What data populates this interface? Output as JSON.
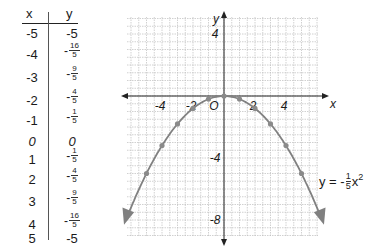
{
  "table": {
    "x_header": "x",
    "y_header": "y",
    "rows": [
      {
        "x": "-5",
        "y": "-5"
      },
      {
        "x": "-4",
        "y_num": "16",
        "y_den": "5",
        "y_neg": "-"
      },
      {
        "x": "-3",
        "y_num": "9",
        "y_den": "5",
        "y_neg": "-"
      },
      {
        "x": "-2",
        "y_num": "4",
        "y_den": "5",
        "y_neg": "-"
      },
      {
        "x": "-1",
        "y_num": "1",
        "y_den": "5",
        "y_neg": "-"
      },
      {
        "x": "0",
        "y": "0"
      },
      {
        "x": "1",
        "y_num": "1",
        "y_den": "5",
        "y_neg": "-"
      },
      {
        "x": "2",
        "y_num": "4",
        "y_den": "5",
        "y_neg": "-"
      },
      {
        "x": "3",
        "y_num": "9",
        "y_den": "5",
        "y_neg": "-"
      },
      {
        "x": "4",
        "y_num": "16",
        "y_den": "5",
        "y_neg": "-"
      },
      {
        "x": "5",
        "y": "-5"
      }
    ]
  },
  "equation": {
    "lhs": "y = -",
    "num": "1",
    "den": "5",
    "var": "x",
    "exp": "2"
  },
  "axis_labels": {
    "x": "x",
    "y": "y",
    "origin": "O",
    "x_ticks": [
      "-4",
      "-2",
      "2",
      "4"
    ],
    "y_ticks": [
      "4",
      "-4",
      "-8"
    ]
  },
  "colors": {
    "curve": "#808080",
    "point": "#8a8a8a",
    "axis": "#222222",
    "grid": "#bdbdbd"
  },
  "chart_data": {
    "type": "line",
    "title": "",
    "function": "y = -(1/5)x^2",
    "xlabel": "x",
    "ylabel": "y",
    "xlim": [
      -6,
      6
    ],
    "ylim": [
      -9,
      5
    ],
    "grid": true,
    "x_tick_labels": [
      -4,
      -2,
      2,
      4
    ],
    "y_tick_labels": [
      4,
      -4,
      -8
    ],
    "series": [
      {
        "name": "y = -1/5 x^2",
        "x": [
          -5,
          -4,
          -3,
          -2,
          -1,
          0,
          1,
          2,
          3,
          4,
          5
        ],
        "y": [
          -5,
          -3.2,
          -1.8,
          -0.8,
          -0.2,
          0,
          -0.2,
          -0.8,
          -1.8,
          -3.2,
          -5
        ]
      }
    ],
    "table_columns": [
      "x",
      "y"
    ],
    "table_rows": [
      [
        "-5",
        "-5"
      ],
      [
        "-4",
        "-16/5"
      ],
      [
        "-3",
        "-9/5"
      ],
      [
        "-2",
        "-4/5"
      ],
      [
        "-1",
        "-1/5"
      ],
      [
        "0",
        "0"
      ],
      [
        "1",
        "-1/5"
      ],
      [
        "2",
        "-4/5"
      ],
      [
        "3",
        "-9/5"
      ],
      [
        "4",
        "-16/5"
      ],
      [
        "5",
        "-5"
      ]
    ]
  }
}
